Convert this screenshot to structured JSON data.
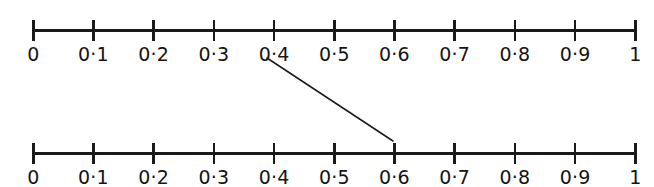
{
  "figure": {
    "type": "number-line-diagram",
    "background_color": "#ffffff",
    "ink_color": "#1a1a1a",
    "lines": [
      {
        "name": "upper-number-line",
        "min": 0,
        "max": 1,
        "tick_count": 11,
        "labels": [
          "0",
          "0·1",
          "0·2",
          "0·3",
          "0·4",
          "0·5",
          "0·6",
          "0·7",
          "0·8",
          "0·9",
          "1"
        ],
        "values": [
          0,
          0.1,
          0.2,
          0.3,
          0.4,
          0.5,
          0.6,
          0.7,
          0.8,
          0.9,
          1
        ],
        "top": 10
      },
      {
        "name": "lower-number-line",
        "min": 0,
        "max": 1,
        "tick_count": 11,
        "labels": [
          "0",
          "0·1",
          "0·2",
          "0·3",
          "0·4",
          "0·5",
          "0·6",
          "0·7",
          "0·8",
          "0·9",
          "1"
        ],
        "values": [
          0,
          0.1,
          0.2,
          0.3,
          0.4,
          0.5,
          0.6,
          0.7,
          0.8,
          0.9,
          1
        ],
        "top": 133
      }
    ],
    "geometry": {
      "axis_start_x": 32,
      "axis_end_x": 634,
      "tick_spacing": 60.2
    },
    "connector": {
      "name": "mapping-arrow",
      "from_value": 0.4,
      "from_line": "upper-number-line",
      "to_value": 0.6,
      "to_line": "lower-number-line",
      "x1": 267,
      "y1": 58,
      "x2": 393,
      "y2": 141,
      "stroke_width": 1.5,
      "color": "#1a1a1a"
    }
  }
}
